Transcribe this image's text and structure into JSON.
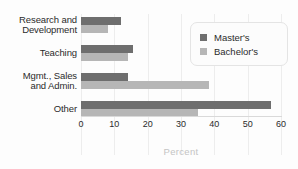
{
  "chart_data": {
    "type": "bar",
    "orientation": "horizontal",
    "title": "",
    "xlabel": "Percent",
    "ylabel": "",
    "xlim": [
      0,
      60
    ],
    "xticks": [
      "0",
      "10",
      "20",
      "30",
      "40",
      "50",
      "60"
    ],
    "grid": true,
    "legend_position": "top-right",
    "categories": [
      "Research and Development",
      "Teaching",
      "Mgmt., Sales and Admin.",
      "Other"
    ],
    "category_lines": [
      [
        "Research and",
        "Development"
      ],
      [
        "Teaching"
      ],
      [
        "Mgmt., Sales",
        "and Admin."
      ],
      [
        "Other"
      ]
    ],
    "series": [
      {
        "name": "Master's",
        "color": "#6e6e6e",
        "values": [
          12,
          15.5,
          14,
          57
        ]
      },
      {
        "name": "Bachelor's",
        "color": "#b6b6b6",
        "values": [
          8,
          14,
          38.5,
          35
        ]
      }
    ]
  },
  "legend": {
    "items": [
      {
        "label": "Master's",
        "swatch": "masters"
      },
      {
        "label": "Bachelor's",
        "swatch": "bachelors"
      }
    ]
  },
  "colors": {
    "masters": "#6e6e6e",
    "bachelors": "#b6b6b6",
    "axis_title": "#c4c4c4",
    "grid": "#f0f0f0",
    "background": "#fdfdfd"
  }
}
